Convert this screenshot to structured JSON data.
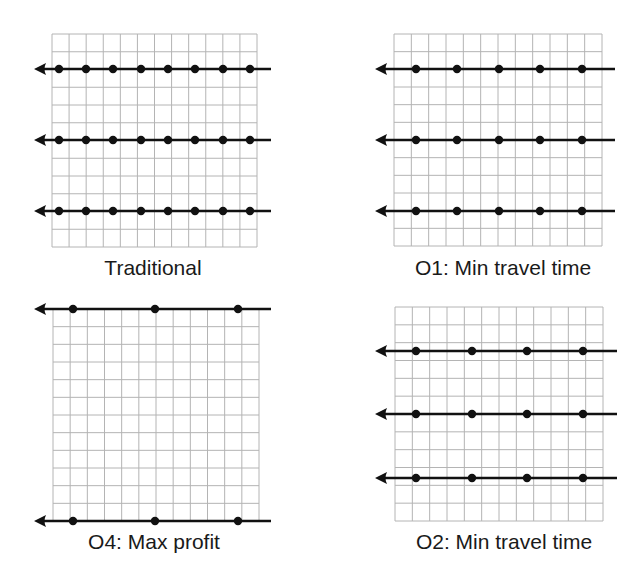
{
  "figure": {
    "width": 644,
    "height": 575,
    "colors": {
      "grid_line": "#b4b4b4",
      "route_line": "#111111",
      "stop_dot": "#111111",
      "label_text": "#1a1a1a",
      "background": "#ffffff"
    }
  },
  "panels": [
    {
      "id": "traditional",
      "label": "Traditional",
      "grid": {
        "x": 52,
        "y": 34,
        "width": 205,
        "height": 213,
        "cols": 12,
        "rows": 12
      },
      "label_pos": {
        "cx": 153,
        "top": 257
      },
      "routes": [
        {
          "y": 69,
          "x_start": 34,
          "x_end": 271,
          "direction": "left",
          "stops_x": [
            59,
            86,
            113,
            141,
            168,
            195,
            223,
            250
          ]
        },
        {
          "y": 140,
          "x_start": 34,
          "x_end": 271,
          "direction": "left",
          "stops_x": [
            59,
            86,
            113,
            141,
            168,
            195,
            223,
            250
          ]
        },
        {
          "y": 211,
          "x_start": 34,
          "x_end": 271,
          "direction": "left",
          "stops_x": [
            59,
            86,
            113,
            141,
            168,
            195,
            223,
            250
          ]
        }
      ]
    },
    {
      "id": "o1",
      "label": "O1: Min travel time",
      "grid": {
        "x": 394,
        "y": 34,
        "width": 208,
        "height": 212,
        "cols": 12,
        "rows": 12
      },
      "label_pos": {
        "cx": 503,
        "top": 257
      },
      "routes": [
        {
          "y": 69,
          "x_start": 375,
          "x_end": 615,
          "direction": "left",
          "stops_x": [
            416,
            457,
            499,
            540,
            582
          ]
        },
        {
          "y": 140,
          "x_start": 375,
          "x_end": 615,
          "direction": "left",
          "stops_x": [
            416,
            457,
            499,
            540,
            582
          ]
        },
        {
          "y": 211,
          "x_start": 375,
          "x_end": 615,
          "direction": "left",
          "stops_x": [
            416,
            457,
            499,
            540,
            582
          ]
        }
      ]
    },
    {
      "id": "o4",
      "label": "O4: Max profit",
      "grid": {
        "x": 53,
        "y": 309,
        "width": 206,
        "height": 212,
        "cols": 12,
        "rows": 12
      },
      "label_pos": {
        "cx": 154,
        "top": 531
      },
      "routes": [
        {
          "y": 309,
          "x_start": 34,
          "x_end": 271,
          "direction": "left",
          "stops_x": [
            73,
            155,
            238
          ]
        },
        {
          "y": 521,
          "x_start": 34,
          "x_end": 271,
          "direction": "left",
          "stops_x": [
            73,
            155,
            238
          ]
        }
      ]
    },
    {
      "id": "o2",
      "label": "O2: Min travel time",
      "grid": {
        "x": 395,
        "y": 307,
        "width": 208,
        "height": 214,
        "cols": 12,
        "rows": 12
      },
      "label_pos": {
        "cx": 504,
        "top": 531
      },
      "routes": [
        {
          "y": 351,
          "x_start": 375,
          "x_end": 617,
          "direction": "left",
          "stops_x": [
            416,
            472,
            527,
            583
          ]
        },
        {
          "y": 414,
          "x_start": 375,
          "x_end": 617,
          "direction": "left",
          "stops_x": [
            416,
            472,
            527,
            583
          ]
        },
        {
          "y": 478,
          "x_start": 375,
          "x_end": 617,
          "direction": "left",
          "stops_x": [
            416,
            472,
            527,
            583
          ]
        }
      ]
    }
  ]
}
